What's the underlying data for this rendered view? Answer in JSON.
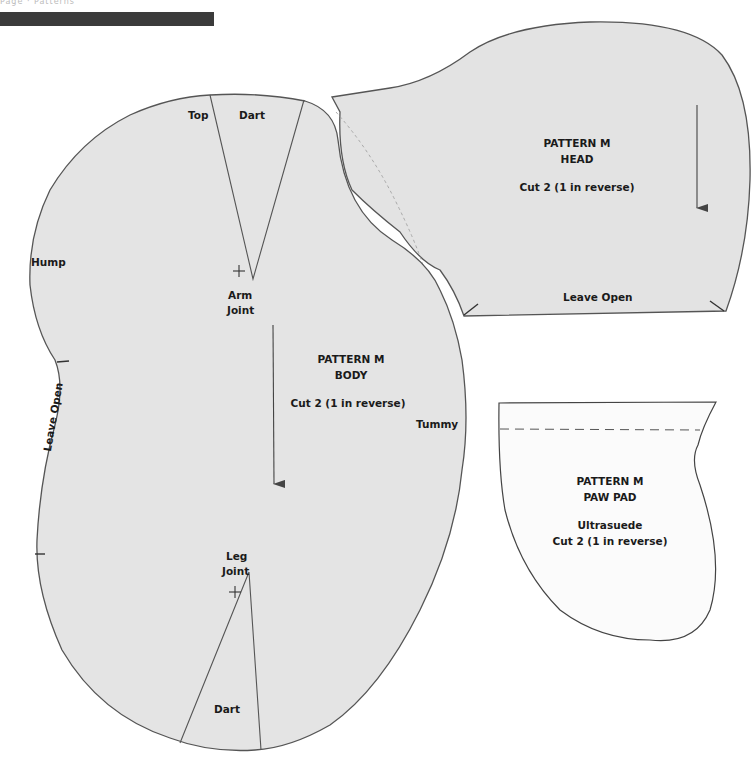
{
  "header": {
    "text": "Page · Patterns",
    "bar_color": "#3b3b3b"
  },
  "colors": {
    "fabric_fill": "#e4e4e4",
    "paper_fill": "#fbfbfb",
    "outline": "#555555",
    "text": "#1a1a1a"
  },
  "pieces": {
    "body": {
      "title": "PATTERN M",
      "name": "BODY",
      "cut": "Cut 2 (1 in reverse)",
      "labels": {
        "top": "Top",
        "top_dart": "Dart",
        "hump": "Hump",
        "arm_joint_1": "Arm",
        "arm_joint_2": "Joint",
        "tummy": "Tummy",
        "leave_open": "Leave Open",
        "leg_joint_1": "Leg",
        "leg_joint_2": "Joint",
        "bottom_dart": "Dart"
      },
      "markers": [
        "arm-joint-cross",
        "leg-joint-cross",
        "grainline-arrow"
      ]
    },
    "head": {
      "title": "PATTERN M",
      "name": "HEAD",
      "cut": "Cut 2 (1 in reverse)",
      "labels": {
        "leave_open": "Leave Open"
      },
      "markers": [
        "grainline-arrow"
      ]
    },
    "paw_pad": {
      "title": "PATTERN M",
      "name": "PAW PAD",
      "material": "Ultrasuede",
      "cut": "Cut 2 (1 in reverse)",
      "markers": [
        "seam-allowance-dashed-line"
      ]
    }
  }
}
